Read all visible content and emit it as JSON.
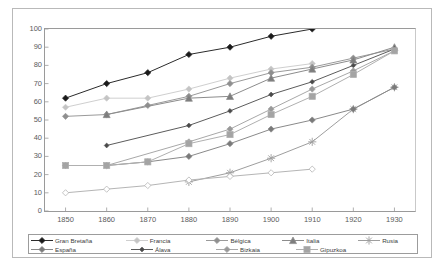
{
  "chart_data": {
    "type": "line",
    "title": "",
    "subtitle": "",
    "xlabel": "",
    "ylabel": "",
    "x": [
      1850,
      1860,
      1870,
      1880,
      1890,
      1900,
      1910,
      1920,
      1930
    ],
    "xtick_labels": [
      "1850",
      "1860",
      "1870",
      "1880",
      "1890",
      "1900",
      "1910",
      "1920",
      "1930"
    ],
    "ytick_labels": [
      "0",
      "10",
      "20",
      "30",
      "40",
      "50",
      "60",
      "70",
      "80",
      "90",
      "100"
    ],
    "ylim": [
      0,
      100
    ],
    "xlim": [
      1845,
      1935
    ],
    "ytick_step": 10,
    "grid": false,
    "legend_position": "bottom",
    "legend_columns": 5,
    "legend_rows": 2,
    "series": [
      {
        "name": "Gran Bretaña",
        "color": "#2b2b2b",
        "marker": "diamond",
        "marker_fill": "#1a1a1a",
        "x": [
          1850,
          1860,
          1870,
          1880,
          1890,
          1900,
          1910
        ],
        "values": [
          62,
          70,
          76,
          86,
          90,
          96,
          100
        ]
      },
      {
        "name": "Francia",
        "color": "#cfcfcf",
        "marker": "diamond",
        "marker_fill": "#c4c4c4",
        "x": [
          1850,
          1860,
          1870,
          1880,
          1890,
          1900,
          1910
        ],
        "values": [
          57,
          62,
          62,
          67,
          73,
          78,
          81
        ]
      },
      {
        "name": "Bélgica",
        "color": "#9a9a9a",
        "marker": "diamond",
        "marker_fill": "#8f8f8f",
        "x": [
          1850,
          1860,
          1870,
          1880,
          1890,
          1900,
          1910,
          1920,
          1930
        ],
        "values": [
          52,
          53,
          58,
          63,
          70,
          76,
          79,
          84,
          89
        ]
      },
      {
        "name": "Italia",
        "color": "#8c8c8c",
        "marker": "triangle",
        "marker_fill": "#7d7d7d",
        "x": [
          1860,
          1880,
          1890,
          1900,
          1910,
          1920,
          1930
        ],
        "values": [
          53,
          62,
          63,
          73,
          78,
          83,
          90
        ]
      },
      {
        "name": "Rusia",
        "color": "#9e9e9e",
        "marker": "star",
        "marker_fill": "#9e9e9e",
        "x": [
          1880,
          1890,
          1900,
          1910,
          1920,
          1930
        ],
        "values": [
          16,
          21,
          29,
          38,
          56,
          68
        ]
      },
      {
        "name": "España",
        "color": "#8a8a8a",
        "marker": "diamond",
        "marker_fill": "#7a7a7a",
        "x": [
          1850,
          1860,
          1870,
          1880,
          1890,
          1900,
          1910,
          1920,
          1930
        ],
        "values": [
          25,
          25,
          27,
          30,
          37,
          45,
          50,
          56,
          68
        ]
      },
      {
        "name": "Álava",
        "color": "#5c5c5c",
        "marker": "diamond-small",
        "marker_fill": "#4a4a4a",
        "x": [
          1860,
          1880,
          1890,
          1900,
          1910,
          1920,
          1930
        ],
        "values": [
          36,
          47,
          55,
          64,
          71,
          80,
          89
        ]
      },
      {
        "name": "Bizkaia",
        "color": "#a8a8a8",
        "marker": "diamond",
        "marker_fill": "#999999",
        "x": [
          1860,
          1880,
          1890,
          1900,
          1910,
          1920,
          1930
        ],
        "values": [
          25,
          38,
          45,
          56,
          67,
          77,
          88
        ]
      },
      {
        "name": "Gipuzkoa",
        "color": "#b0b0b0",
        "marker": "square",
        "marker_fill": "#a4a4a4",
        "x": [
          1850,
          1860,
          1870,
          1880,
          1890,
          1900,
          1910,
          1920,
          1930
        ],
        "values": [
          25,
          25,
          27,
          37,
          42,
          53,
          63,
          75,
          88
        ]
      },
      {
        "name": "Alemania",
        "color": "#b5b5b5",
        "marker": "diamond-open",
        "marker_fill": "#ffffff",
        "x": [
          1850,
          1860,
          1870,
          1880,
          1890,
          1900,
          1910
        ],
        "values": [
          10,
          12,
          14,
          17,
          19,
          21,
          23
        ]
      }
    ]
  },
  "legend": {
    "row1": [
      {
        "label": "Gran Bretaña"
      },
      {
        "label": "Francia"
      },
      {
        "label": "Bélgica"
      },
      {
        "label": "Italia"
      },
      {
        "label": "Rusia"
      }
    ],
    "row2": [
      {
        "label": "España"
      },
      {
        "label": "Álava"
      },
      {
        "label": "Bizkaia"
      },
      {
        "label": "Gipuzkoa"
      }
    ]
  }
}
